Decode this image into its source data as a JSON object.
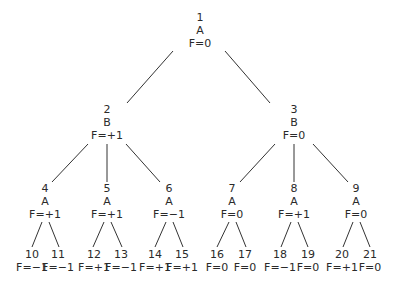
{
  "tree": {
    "nodes": [
      {
        "id": "1",
        "player": "A",
        "value": "F=0",
        "x": 200,
        "y": 11
      },
      {
        "id": "2",
        "player": "B",
        "value": "F=+1",
        "x": 107,
        "y": 103
      },
      {
        "id": "3",
        "player": "B",
        "value": "F=0",
        "x": 294,
        "y": 103
      },
      {
        "id": "4",
        "player": "A",
        "value": "F=+1",
        "x": 45,
        "y": 182
      },
      {
        "id": "5",
        "player": "A",
        "value": "F=+1",
        "x": 107,
        "y": 182
      },
      {
        "id": "6",
        "player": "A",
        "value": "F=−1",
        "x": 169,
        "y": 182
      },
      {
        "id": "7",
        "player": "A",
        "value": "F=0",
        "x": 232,
        "y": 182
      },
      {
        "id": "8",
        "player": "A",
        "value": "F=+1",
        "x": 294,
        "y": 182
      },
      {
        "id": "9",
        "player": "A",
        "value": "F=0",
        "x": 356,
        "y": 182
      },
      {
        "id": "10",
        "value": "F=−1",
        "x": 32,
        "y": 248
      },
      {
        "id": "11",
        "value": "F=−1",
        "x": 58,
        "y": 248
      },
      {
        "id": "12",
        "value": "F=+1",
        "x": 94,
        "y": 248
      },
      {
        "id": "13",
        "value": "F=−1",
        "x": 121,
        "y": 248
      },
      {
        "id": "14",
        "value": "F=+1",
        "x": 155,
        "y": 248
      },
      {
        "id": "15",
        "value": "F=+1",
        "x": 182,
        "y": 248
      },
      {
        "id": "16",
        "value": "F=0",
        "x": 217,
        "y": 248
      },
      {
        "id": "17",
        "value": "F=0",
        "x": 245,
        "y": 248
      },
      {
        "id": "18",
        "value": "F=−1",
        "x": 280,
        "y": 248
      },
      {
        "id": "19",
        "value": "F=0",
        "x": 308,
        "y": 248
      },
      {
        "id": "20",
        "value": "F=+1",
        "x": 342,
        "y": 248
      },
      {
        "id": "21",
        "value": "F=0",
        "x": 370,
        "y": 248
      }
    ],
    "edges": [
      {
        "from": "1",
        "to": "2",
        "x1": 173,
        "y1": 51,
        "x2": 127,
        "y2": 103
      },
      {
        "from": "1",
        "to": "3",
        "x1": 225,
        "y1": 51,
        "x2": 270,
        "y2": 103
      },
      {
        "from": "2",
        "to": "4",
        "x1": 88,
        "y1": 144,
        "x2": 52,
        "y2": 182
      },
      {
        "from": "2",
        "to": "5",
        "x1": 107,
        "y1": 144,
        "x2": 107,
        "y2": 182
      },
      {
        "from": "2",
        "to": "6",
        "x1": 126,
        "y1": 144,
        "x2": 160,
        "y2": 182
      },
      {
        "from": "3",
        "to": "7",
        "x1": 275,
        "y1": 144,
        "x2": 240,
        "y2": 182
      },
      {
        "from": "3",
        "to": "8",
        "x1": 294,
        "y1": 144,
        "x2": 294,
        "y2": 182
      },
      {
        "from": "3",
        "to": "9",
        "x1": 313,
        "y1": 144,
        "x2": 348,
        "y2": 182
      },
      {
        "from": "4",
        "to": "10",
        "x1": 42,
        "y1": 222,
        "x2": 32,
        "y2": 247
      },
      {
        "from": "4",
        "to": "11",
        "x1": 49,
        "y1": 222,
        "x2": 59,
        "y2": 247
      },
      {
        "from": "5",
        "to": "12",
        "x1": 104,
        "y1": 222,
        "x2": 93,
        "y2": 247
      },
      {
        "from": "5",
        "to": "13",
        "x1": 111,
        "y1": 222,
        "x2": 122,
        "y2": 247
      },
      {
        "from": "6",
        "to": "14",
        "x1": 166,
        "y1": 222,
        "x2": 155,
        "y2": 247
      },
      {
        "from": "6",
        "to": "15",
        "x1": 173,
        "y1": 222,
        "x2": 183,
        "y2": 247
      },
      {
        "from": "7",
        "to": "16",
        "x1": 229,
        "y1": 222,
        "x2": 217,
        "y2": 247
      },
      {
        "from": "7",
        "to": "17",
        "x1": 236,
        "y1": 222,
        "x2": 246,
        "y2": 247
      },
      {
        "from": "8",
        "to": "18",
        "x1": 291,
        "y1": 222,
        "x2": 281,
        "y2": 247
      },
      {
        "from": "8",
        "to": "19",
        "x1": 298,
        "y1": 222,
        "x2": 308,
        "y2": 247
      },
      {
        "from": "9",
        "to": "20",
        "x1": 353,
        "y1": 222,
        "x2": 343,
        "y2": 247
      },
      {
        "from": "9",
        "to": "21",
        "x1": 360,
        "y1": 222,
        "x2": 370,
        "y2": 247
      }
    ]
  }
}
